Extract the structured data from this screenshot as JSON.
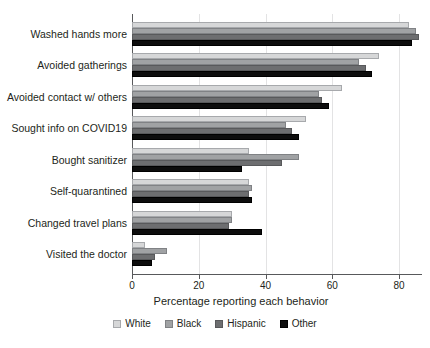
{
  "chart_data": {
    "type": "bar",
    "orientation": "horizontal",
    "title": "",
    "xlabel": "Percentage reporting each behavior",
    "ylabel": "",
    "xlim": [
      0,
      87
    ],
    "xticks": [
      0,
      20,
      40,
      60,
      80
    ],
    "grid": true,
    "legend_position": "bottom",
    "categories": [
      "Washed hands more",
      "Avoided gatherings",
      "Avoided contact w/ others",
      "Sought info on COVID19",
      "Bought sanitizer",
      "Self-quarantined",
      "Changed travel plans",
      "Visited the doctor"
    ],
    "series": [
      {
        "name": "White",
        "color": "#d6d7d8",
        "values": [
          83,
          74,
          63,
          52,
          35,
          35,
          30,
          4
        ]
      },
      {
        "name": "Black",
        "color": "#a0a2a4",
        "values": [
          85,
          68,
          56,
          46,
          50,
          36,
          30,
          10.5
        ]
      },
      {
        "name": "Hispanic",
        "color": "#6d6e70",
        "values": [
          86,
          70,
          57,
          48,
          45,
          35,
          29,
          7
        ]
      },
      {
        "name": "Other",
        "color": "#0d0d0d",
        "values": [
          84,
          72,
          59,
          50,
          33,
          36,
          39,
          6
        ]
      }
    ]
  },
  "legend": {
    "entries": [
      {
        "label": "White",
        "key": "white"
      },
      {
        "label": "Black",
        "key": "black"
      },
      {
        "label": "Hispanic",
        "key": "hispanic"
      },
      {
        "label": "Other",
        "key": "other"
      }
    ]
  }
}
